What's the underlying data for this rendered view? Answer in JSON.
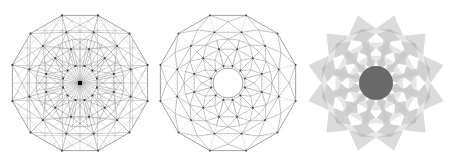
{
  "page": {
    "background_color": "#ffffff"
  },
  "figures": [
    {
      "id": "triangulation",
      "name": "Dodecagonal triangulated mesh with radial spokes",
      "stroke_color": "#8a8a8a",
      "node_color": "#3a3a3a",
      "grid_color": "#b8b8b8",
      "hub_color": "#000000",
      "center_x": 80,
      "center_y": 83,
      "outer_radius": 70,
      "sides": 12,
      "spoke_count": 36,
      "inner_circle_radius": 44,
      "rings": 4,
      "grid_spacing": 17.5,
      "fill": "none"
    },
    {
      "id": "dual",
      "name": "Dual tessellation with hollow circular hub",
      "stroke_color": "#8a8a8a",
      "node_color": "#3a3a3a",
      "grid_color": "#c8c8c8",
      "dotted_color": "#d0d0d0",
      "center_x": 76,
      "center_y": 83,
      "outer_radius": 70,
      "sides": 12,
      "spoke_count": 12,
      "hub_radius": 15,
      "inner_circle_radius": 44,
      "rings": 4,
      "fill": "none"
    },
    {
      "id": "shaded",
      "name": "Grayscale shaded rosette with dark hub",
      "stroke_color": "none",
      "cell_fill": "#9a9a9a",
      "cell_opacity": 0.45,
      "hub_fill": "#5a5a5a",
      "spoke_fill": "#c9c9c9",
      "center_x": 76,
      "center_y": 83,
      "outer_radius": 70,
      "sides": 12,
      "spoke_count": 12,
      "hub_radius": 17,
      "rings": 3,
      "fill": "gray-translucent"
    }
  ],
  "chart_data": {
    "type": "diagram",
    "panels": [
      "triangulation",
      "dual",
      "shaded"
    ],
    "symmetry_order": 12,
    "panel_count": 3
  }
}
